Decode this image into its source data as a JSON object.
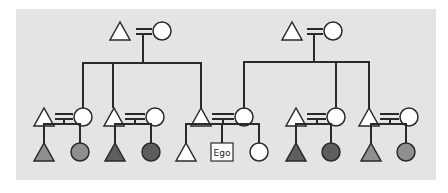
{
  "diagram": {
    "type": "kinship-chart",
    "colors": {
      "background": "#e4e4e4",
      "line": "#2a2a2a",
      "unshaded": "#ffffff",
      "light_shade": "#8f8f8f",
      "dark_shade": "#5e5e5e"
    },
    "generations": [
      {
        "level": "grandparents",
        "couples": [
          {
            "id": "gp-left",
            "husband": {
              "sex": "male",
              "shade": "unshaded"
            },
            "wife": {
              "sex": "female",
              "shade": "unshaded"
            }
          },
          {
            "id": "gp-right",
            "husband": {
              "sex": "male",
              "shade": "unshaded"
            },
            "wife": {
              "sex": "female",
              "shade": "unshaded"
            }
          }
        ]
      },
      {
        "level": "parents",
        "couples": [
          {
            "id": "c1",
            "parent_of": "gp-left",
            "linked_spouse": "wife",
            "husband": {
              "sex": "male",
              "shade": "unshaded"
            },
            "wife": {
              "sex": "female",
              "shade": "unshaded"
            }
          },
          {
            "id": "c2",
            "parent_of": "gp-left",
            "linked_spouse": "husband",
            "husband": {
              "sex": "male",
              "shade": "unshaded"
            },
            "wife": {
              "sex": "female",
              "shade": "unshaded"
            }
          },
          {
            "id": "c3",
            "parent_of_husband": "gp-left",
            "parent_of_wife": "gp-right",
            "husband": {
              "sex": "male",
              "shade": "unshaded"
            },
            "wife": {
              "sex": "female",
              "shade": "unshaded"
            }
          },
          {
            "id": "c4",
            "parent_of": "gp-right",
            "linked_spouse": "wife",
            "husband": {
              "sex": "male",
              "shade": "unshaded"
            },
            "wife": {
              "sex": "female",
              "shade": "unshaded"
            }
          },
          {
            "id": "c5",
            "parent_of": "gp-right",
            "linked_spouse": "husband",
            "husband": {
              "sex": "male",
              "shade": "unshaded"
            },
            "wife": {
              "sex": "female",
              "shade": "unshaded"
            }
          }
        ]
      },
      {
        "level": "ego-generation",
        "sibling_sets": [
          {
            "parents": "c1",
            "children": [
              {
                "sex": "male",
                "shade": "light_shade"
              },
              {
                "sex": "female",
                "shade": "light_shade"
              }
            ]
          },
          {
            "parents": "c2",
            "children": [
              {
                "sex": "male",
                "shade": "dark_shade"
              },
              {
                "sex": "female",
                "shade": "dark_shade"
              }
            ]
          },
          {
            "parents": "c3",
            "children": [
              {
                "sex": "male",
                "shade": "unshaded"
              },
              {
                "sex": "ego",
                "label": "Ego"
              },
              {
                "sex": "female",
                "shade": "unshaded"
              }
            ]
          },
          {
            "parents": "c4",
            "children": [
              {
                "sex": "male",
                "shade": "dark_shade"
              },
              {
                "sex": "female",
                "shade": "dark_shade"
              }
            ]
          },
          {
            "parents": "c5",
            "children": [
              {
                "sex": "male",
                "shade": "light_shade"
              },
              {
                "sex": "female",
                "shade": "light_shade"
              }
            ]
          }
        ]
      }
    ],
    "ego_label": "Ego"
  }
}
